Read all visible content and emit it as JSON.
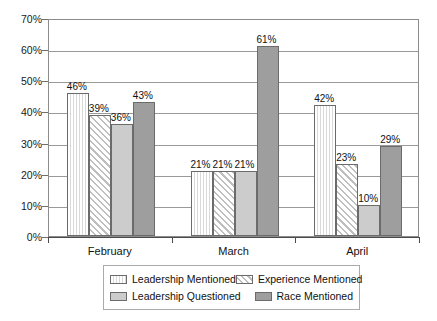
{
  "chart_data": {
    "type": "bar",
    "title": "",
    "subtitle": "",
    "xlabel": "",
    "ylabel": "",
    "categories": [
      "February",
      "March",
      "April"
    ],
    "series": [
      {
        "name": "Leadership Mentioned",
        "values": [
          46,
          21,
          42
        ],
        "pattern": "vertical-stripes",
        "color": "#f2f2f2"
      },
      {
        "name": "Experience Mentioned",
        "values": [
          39,
          21,
          23
        ],
        "pattern": "diagonal-stripes",
        "color": "#ffffff"
      },
      {
        "name": "Leadership Questioned",
        "values": [
          36,
          21,
          10
        ],
        "pattern": "solid",
        "color": "#cccccc"
      },
      {
        "name": "Race Mentioned",
        "values": [
          43,
          61,
          29
        ],
        "pattern": "solid",
        "color": "#9e9e9e"
      }
    ],
    "value_labels": [
      [
        "46%",
        "39%",
        "36%",
        "43%"
      ],
      [
        "21%",
        "21%",
        "21%",
        "61%"
      ],
      [
        "42%",
        "23%",
        "10%",
        "29%"
      ]
    ],
    "ylim": [
      0,
      70
    ],
    "yticks": [
      0,
      10,
      20,
      30,
      40,
      50,
      60,
      70
    ],
    "ytick_labels": [
      "0%",
      "10%",
      "20%",
      "30%",
      "40%",
      "50%",
      "60%",
      "70%"
    ],
    "grid": true,
    "grid_axis": "y",
    "legend_position": "bottom",
    "legend_columns": 2,
    "legend_order": [
      [
        "Leadership Mentioned",
        "Experience Mentioned"
      ],
      [
        "Leadership Questioned",
        "Race Mentioned"
      ]
    ],
    "axis_frame_color": "#8c8c8c",
    "gridline_color": "#9a9a9a"
  }
}
